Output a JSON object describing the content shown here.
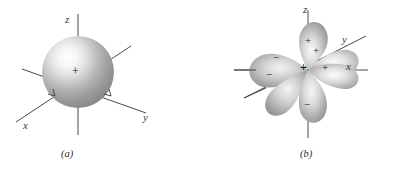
{
  "figure": {
    "background_color": "#ffffff",
    "line_color": "#4a4a4a",
    "orbital_fill_dark": "#8f8f8f",
    "orbital_fill_light": "#fbfbfb",
    "panels": [
      {
        "id": "a",
        "caption": "(a)",
        "kind": "s-orbital-sphere",
        "center_sign": "+",
        "axes": [
          {
            "name": "z",
            "label": "z",
            "direction": "up"
          },
          {
            "name": "y",
            "label": "y",
            "direction": "down-right"
          },
          {
            "name": "x",
            "label": "x",
            "direction": "down-left"
          }
        ]
      },
      {
        "id": "b",
        "caption": "(b)",
        "kind": "d-orbital-four-lobes",
        "center_sign": "+",
        "axes": [
          {
            "name": "z",
            "label": "z",
            "direction": "up"
          },
          {
            "name": "y",
            "label": "y",
            "direction": "up-right"
          },
          {
            "name": "x",
            "label": "x",
            "direction": "right"
          }
        ],
        "lobes": [
          {
            "name": "lobe-top",
            "sign": "+"
          },
          {
            "name": "lobe-bottom",
            "sign": "−"
          },
          {
            "name": "lobe-right-x",
            "sign": "+"
          },
          {
            "name": "lobe-right-y",
            "sign": "+"
          },
          {
            "name": "lobe-left-x",
            "sign": "−"
          },
          {
            "name": "lobe-left-y",
            "sign": "−"
          }
        ]
      }
    ]
  }
}
